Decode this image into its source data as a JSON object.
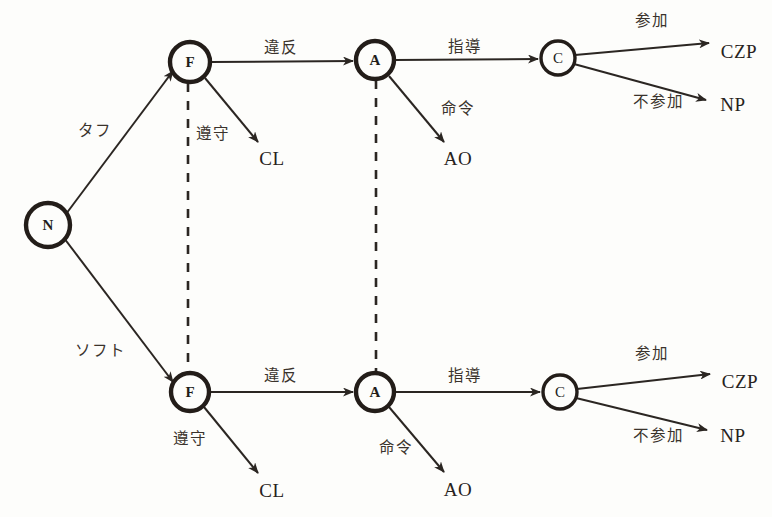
{
  "figure": {
    "type": "extensive-form game tree",
    "background_color": "#fdfdfb",
    "ink_color": "#2b2622",
    "width": 772,
    "height": 517
  },
  "nodes": [
    {
      "id": "N",
      "label": "N",
      "x": 48,
      "y": 225,
      "r": 22,
      "weight": "bold"
    },
    {
      "id": "F_top",
      "label": "F",
      "x": 190,
      "y": 62,
      "r": 20,
      "weight": "bold"
    },
    {
      "id": "A_top",
      "label": "A",
      "x": 375,
      "y": 60,
      "r": 19,
      "weight": "bold"
    },
    {
      "id": "C_top",
      "label": "C",
      "x": 558,
      "y": 58,
      "r": 17,
      "weight": "normal"
    },
    {
      "id": "F_bot",
      "label": "F",
      "x": 190,
      "y": 392,
      "r": 19,
      "weight": "bold"
    },
    {
      "id": "A_bot",
      "label": "A",
      "x": 375,
      "y": 392,
      "r": 19,
      "weight": "bold"
    },
    {
      "id": "C_bot",
      "label": "C",
      "x": 560,
      "y": 392,
      "r": 17,
      "weight": "normal"
    }
  ],
  "terminals": [
    {
      "id": "CL_top",
      "label": "CL",
      "x": 272,
      "y": 158
    },
    {
      "id": "AO_top",
      "label": "AO",
      "x": 458,
      "y": 158
    },
    {
      "id": "CZP_top",
      "label": "CZP",
      "x": 739,
      "y": 51
    },
    {
      "id": "NP_top",
      "label": "NP",
      "x": 733,
      "y": 104
    },
    {
      "id": "CL_bot",
      "label": "CL",
      "x": 272,
      "y": 490
    },
    {
      "id": "AO_bot",
      "label": "AO",
      "x": 458,
      "y": 489
    },
    {
      "id": "CZP_bot",
      "label": "CZP",
      "x": 740,
      "y": 381
    },
    {
      "id": "NP_bot",
      "label": "NP",
      "x": 733,
      "y": 435
    }
  ],
  "edge_labels": [
    {
      "id": "chance-tough",
      "text": "タフ",
      "x": 95,
      "y": 132
    },
    {
      "id": "chance-soft",
      "text": "ソフト",
      "x": 100,
      "y": 352
    },
    {
      "id": "violation-top",
      "text": "違反",
      "x": 281,
      "y": 49
    },
    {
      "id": "compliance-top",
      "text": "遵守",
      "x": 213,
      "y": 135
    },
    {
      "id": "guidance-top",
      "text": "指導",
      "x": 465,
      "y": 48
    },
    {
      "id": "order-top",
      "text": "命令",
      "x": 458,
      "y": 110
    },
    {
      "id": "participate-top",
      "text": "参加",
      "x": 652,
      "y": 22
    },
    {
      "id": "nonparticipate-top",
      "text": "不参加",
      "x": 658,
      "y": 103
    },
    {
      "id": "violation-bot",
      "text": "違反",
      "x": 281,
      "y": 377
    },
    {
      "id": "compliance-bot",
      "text": "遵守",
      "x": 190,
      "y": 440
    },
    {
      "id": "guidance-bot",
      "text": "指導",
      "x": 465,
      "y": 377
    },
    {
      "id": "order-bot",
      "text": "命令",
      "x": 396,
      "y": 449
    },
    {
      "id": "participate-bot",
      "text": "参加",
      "x": 652,
      "y": 355
    },
    {
      "id": "nonparticipate-bot",
      "text": "不参加",
      "x": 658,
      "y": 437
    }
  ],
  "edges": [
    {
      "id": "edge-n-to-f-top",
      "from": "N",
      "to": "F_top",
      "style": "solid",
      "arrow": true,
      "x1": 66,
      "y1": 214,
      "x2": 173,
      "y2": 71
    },
    {
      "id": "edge-n-to-f-bot",
      "from": "N",
      "to": "F_bot",
      "style": "solid",
      "arrow": true,
      "x1": 64,
      "y1": 238,
      "x2": 173,
      "y2": 382
    },
    {
      "id": "edge-f-to-a-top",
      "from": "F_top",
      "to": "A_top",
      "style": "solid",
      "arrow": true,
      "x1": 210,
      "y1": 62,
      "x2": 353,
      "y2": 61
    },
    {
      "id": "edge-f-to-cl-top",
      "from": "F_top",
      "to": "CL_top",
      "style": "solid",
      "arrow": true,
      "x1": 205,
      "y1": 78,
      "x2": 258,
      "y2": 142
    },
    {
      "id": "edge-a-to-c-top",
      "from": "A_top",
      "to": "C_top",
      "style": "solid",
      "arrow": true,
      "x1": 394,
      "y1": 60,
      "x2": 538,
      "y2": 59
    },
    {
      "id": "edge-a-to-ao-top",
      "from": "A_top",
      "to": "AO_top",
      "style": "solid",
      "arrow": true,
      "x1": 389,
      "y1": 76,
      "x2": 444,
      "y2": 142
    },
    {
      "id": "edge-c-to-czp-top",
      "from": "C_top",
      "to": "CZP_top",
      "style": "solid",
      "arrow": true,
      "x1": 575,
      "y1": 55,
      "x2": 709,
      "y2": 43
    },
    {
      "id": "edge-c-to-np-top",
      "from": "C_top",
      "to": "NP_top",
      "style": "solid",
      "arrow": true,
      "x1": 574,
      "y1": 64,
      "x2": 706,
      "y2": 100
    },
    {
      "id": "edge-f-to-a-bot",
      "from": "F_bot",
      "to": "A_bot",
      "style": "solid",
      "arrow": true,
      "x1": 209,
      "y1": 392,
      "x2": 353,
      "y2": 392
    },
    {
      "id": "edge-f-to-cl-bot",
      "from": "F_bot",
      "to": "CL_bot",
      "style": "solid",
      "arrow": true,
      "x1": 204,
      "y1": 407,
      "x2": 258,
      "y2": 473
    },
    {
      "id": "edge-a-to-c-bot",
      "from": "A_bot",
      "to": "C_bot",
      "style": "solid",
      "arrow": true,
      "x1": 394,
      "y1": 392,
      "x2": 540,
      "y2": 392
    },
    {
      "id": "edge-a-to-ao-bot",
      "from": "A_bot",
      "to": "AO_bot",
      "style": "solid",
      "arrow": true,
      "x1": 389,
      "y1": 407,
      "x2": 444,
      "y2": 472
    },
    {
      "id": "edge-c-to-czp-bot",
      "from": "C_bot",
      "to": "CZP_bot",
      "style": "solid",
      "arrow": true,
      "x1": 577,
      "y1": 389,
      "x2": 710,
      "y2": 374
    },
    {
      "id": "edge-c-to-np-bot",
      "from": "C_bot",
      "to": "NP_bot",
      "style": "solid",
      "arrow": true,
      "x1": 576,
      "y1": 398,
      "x2": 707,
      "y2": 430
    }
  ],
  "information_sets": [
    {
      "id": "infoset-f",
      "connects": [
        "F_top",
        "F_bot"
      ],
      "style": "dashed",
      "x1": 188,
      "y1": 83,
      "x2": 188,
      "y2": 372
    },
    {
      "id": "infoset-a",
      "connects": [
        "A_top",
        "A_bot"
      ],
      "style": "dashed",
      "x1": 376,
      "y1": 80,
      "x2": 376,
      "y2": 372
    }
  ]
}
